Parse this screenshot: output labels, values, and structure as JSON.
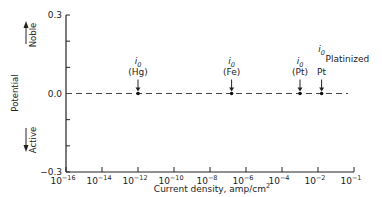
{
  "chart_data": {
    "type": "scatter",
    "title": "",
    "xlabel": "Current density, amp/cm²",
    "xlabel_text": "Current density, amp/cm",
    "xlabel_sup": "2",
    "ylabel": "Potential",
    "y_annotations": {
      "up": "Noble",
      "down": "Active"
    },
    "x_scale": "log",
    "x_ticks": [
      {
        "base": "10",
        "exp": "−16",
        "log": -16
      },
      {
        "base": "10",
        "exp": "−14",
        "log": -14
      },
      {
        "base": "10",
        "exp": "−12",
        "log": -12
      },
      {
        "base": "10",
        "exp": "−10",
        "log": -10
      },
      {
        "base": "10",
        "exp": "−8",
        "log": -8
      },
      {
        "base": "10",
        "exp": "−6",
        "log": -6
      },
      {
        "base": "10",
        "exp": "−4",
        "log": -4
      },
      {
        "base": "10",
        "exp": "−2",
        "log": -2
      },
      {
        "base": "10",
        "exp": "−1",
        "log": 0
      }
    ],
    "y_ticks": [
      {
        "label": "0.3",
        "value": 0.3
      },
      {
        "label": "",
        "value": 0.2
      },
      {
        "label": "",
        "value": 0.1
      },
      {
        "label": "0.0",
        "value": 0.0
      },
      {
        "label": "",
        "value": -0.1
      },
      {
        "label": "",
        "value": -0.2
      },
      {
        "label": "−0.3",
        "value": -0.3
      }
    ],
    "ylim": [
      -0.3,
      0.3
    ],
    "xlim_log": [
      -16,
      0
    ],
    "grid": false,
    "reference_line": {
      "y": 0.0,
      "style": "dashed"
    },
    "series": [
      {
        "name": "Exchange current densities at equilibrium potential",
        "points": [
          {
            "label_top": "i",
            "label_sub": "0",
            "label_bottom": "(Hg)",
            "log_x": -12.0,
            "y": 0.0
          },
          {
            "label_top": "i",
            "label_sub": "0",
            "label_bottom": "(Fe)",
            "log_x": -6.8,
            "y": 0.0
          },
          {
            "label_top": "i",
            "label_sub": "0",
            "label_bottom": "(Pt)",
            "log_x": -3.0,
            "y": 0.0
          },
          {
            "label_top": "i",
            "label_sub": "0",
            "label_bottom": "Pt",
            "label_side": "Platinized",
            "log_x": -1.8,
            "y": 0.0
          }
        ]
      }
    ]
  }
}
